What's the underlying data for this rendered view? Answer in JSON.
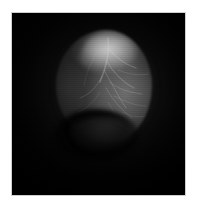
{
  "figure": {
    "caption": "",
    "modality_label": "",
    "plate": {
      "background_color": "#000000",
      "frame_color": "#cfcfcf",
      "page_color": "#ffffff",
      "left": 12,
      "top": 13,
      "width": 173,
      "height": 182
    },
    "structure": {
      "name": "bright-ovoid-structure",
      "description": "rounded grayscale anatomical mass with bright superior crest, darker left flank and a dark concave notch along the inferior border",
      "bounds": {
        "left": 58,
        "top": 31,
        "right": 152,
        "bottom": 140
      },
      "peak_gray": "#cdcdcd",
      "mid_gray": "#6e6e6e",
      "shadow_gray": "#1c1c1c"
    },
    "annotations": []
  },
  "chart_data": {
    "type": "heatmap",
    "title": "",
    "xlabel": "",
    "ylabel": "",
    "colormap": "grayscale",
    "value_range": [
      0,
      255
    ],
    "grid": false,
    "legend": "none"
  }
}
